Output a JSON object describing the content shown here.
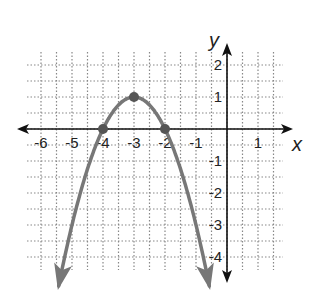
{
  "chart_data": {
    "type": "line",
    "title": "",
    "xlabel": "x",
    "ylabel": "y",
    "xlim": [
      -6,
      1.5
    ],
    "ylim": [
      -4,
      2
    ],
    "grid": true,
    "grid_step": 0.5,
    "x_ticks": [
      -6,
      -5,
      -4,
      -3,
      -2,
      -1,
      1
    ],
    "y_ticks": [
      2,
      1,
      -1,
      -2,
      -3,
      -4
    ],
    "x_tick_labels": [
      "-6",
      "-5",
      "-4",
      "-3",
      "-2",
      "-1",
      "1"
    ],
    "y_tick_labels": [
      "2",
      "1",
      "-1",
      "-2",
      "-3",
      "-4"
    ],
    "series": [
      {
        "name": "parabola",
        "equation": "y = -(x+3)^2 + 1",
        "vertex": [
          -3,
          1
        ],
        "roots": [
          -4,
          -2
        ],
        "x_range": [
          -5.43,
          -0.57
        ],
        "color": "#777777",
        "arrows_at_ends": true
      }
    ],
    "points": [
      {
        "x": -4,
        "y": 0
      },
      {
        "x": -3,
        "y": 1
      },
      {
        "x": -2,
        "y": 0
      }
    ]
  },
  "colors": {
    "curve": "#777777",
    "point": "#555555",
    "axis": "#111111",
    "grid": "#888888"
  }
}
